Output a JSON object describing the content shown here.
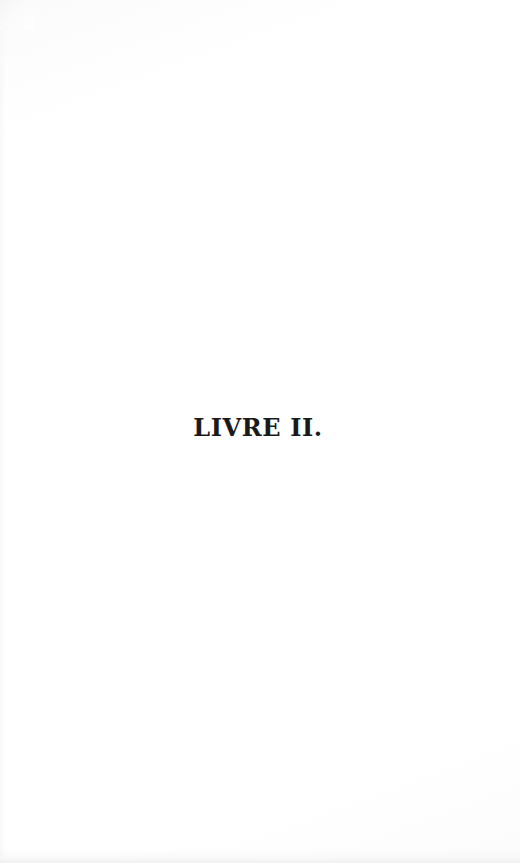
{
  "page": {
    "kind": "scanned-book-page",
    "width": 520,
    "height": 863,
    "background_color": "#ffffff",
    "ink_color": "#1a1a1a"
  },
  "content": {
    "division_title": {
      "full_text": "LIVRE II.",
      "part_label": "LIVRE",
      "part_number": "II.",
      "language": "fr",
      "alignment": "center"
    }
  },
  "artifacts": {
    "top_left_smudge_color": "#f4f4f4",
    "bottom_edge_shadow_color": "#ebebeb",
    "left_edge_vignette_color": "#f6f6f6"
  }
}
